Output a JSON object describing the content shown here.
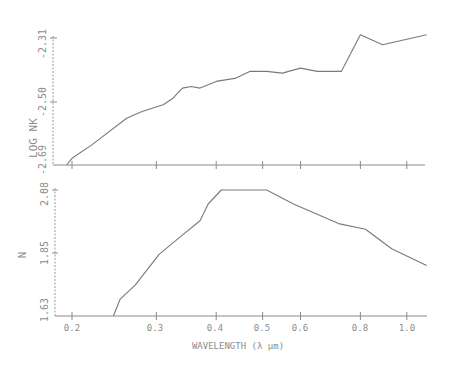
{
  "chart_data": [
    {
      "type": "line",
      "title": "",
      "xlabel": "",
      "ylabel": "LOG NK",
      "xscale": "log",
      "xlim": [
        0.195,
        1.1
      ],
      "ylim": [
        -2.69,
        -2.31
      ],
      "yticks": [
        -2.69,
        -2.5,
        -2.31
      ],
      "ytick_labels": [
        "-2.69",
        "-2.50",
        "-2.31"
      ],
      "grid": false,
      "series": [
        {
          "name": "log nk",
          "x": [
            0.195,
            0.2,
            0.22,
            0.26,
            0.28,
            0.31,
            0.325,
            0.34,
            0.355,
            0.37,
            0.4,
            0.44,
            0.47,
            0.51,
            0.55,
            0.6,
            0.65,
            0.73,
            0.8,
            0.89,
            1.1
          ],
          "y": [
            -2.69,
            -2.67,
            -2.63,
            -2.55,
            -2.53,
            -2.51,
            -2.49,
            -2.46,
            -2.455,
            -2.46,
            -2.44,
            -2.43,
            -2.41,
            -2.41,
            -2.415,
            -2.4,
            -2.41,
            -2.41,
            -2.3,
            -2.33,
            -2.3
          ]
        }
      ]
    },
    {
      "type": "line",
      "title": "",
      "xlabel": "WAVELENGTH (λ µm)",
      "ylabel": "N",
      "xscale": "log",
      "xlim": [
        0.195,
        1.1
      ],
      "ylim": [
        1.63,
        2.08
      ],
      "yticks": [
        1.63,
        1.85,
        2.08
      ],
      "ytick_labels": [
        "1.63",
        "1.85",
        "2.08"
      ],
      "xticks": [
        0.2,
        0.3,
        0.4,
        0.5,
        0.6,
        0.8,
        1.0
      ],
      "xtick_labels": [
        "0.2",
        "0.3",
        "0.4",
        "0.5",
        "0.6",
        "0.8",
        "1.0"
      ],
      "grid": false,
      "series": [
        {
          "name": "n",
          "x": [
            0.244,
            0.252,
            0.271,
            0.304,
            0.335,
            0.37,
            0.385,
            0.41,
            0.51,
            0.58,
            0.72,
            0.82,
            0.93,
            1.1
          ],
          "y": [
            1.63,
            1.69,
            1.74,
            1.85,
            1.91,
            1.97,
            2.03,
            2.08,
            2.08,
            2.03,
            1.96,
            1.94,
            1.87,
            1.81
          ]
        }
      ]
    }
  ],
  "labels": {
    "top_ylabel": "LOG NK",
    "bottom_ylabel": "N",
    "xlabel": "WAVELENGTH (λ µm)",
    "top_yticks": [
      "-2.31",
      "-2.50",
      "-2.69"
    ],
    "bottom_yticks": [
      "2.08",
      "1.85",
      "1.63"
    ],
    "xticks": [
      "0.2",
      "0.3",
      "0.4",
      "0.5",
      "0.6",
      "0.8",
      "1.0"
    ]
  }
}
